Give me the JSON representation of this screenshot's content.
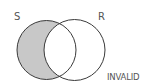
{
  "diagram": {
    "type": "venn",
    "sets": [
      {
        "label": "S",
        "cx": 46.5,
        "cy": 50,
        "r": 29.5
      },
      {
        "label": "R",
        "cx": 74.5,
        "cy": 50,
        "r": 30.5
      }
    ],
    "shaded_region": "S-only",
    "verdict": "INVALID",
    "colors": {
      "shade": "#c8c8c8",
      "stroke": "#3a3a3a",
      "text": "#555555"
    }
  }
}
